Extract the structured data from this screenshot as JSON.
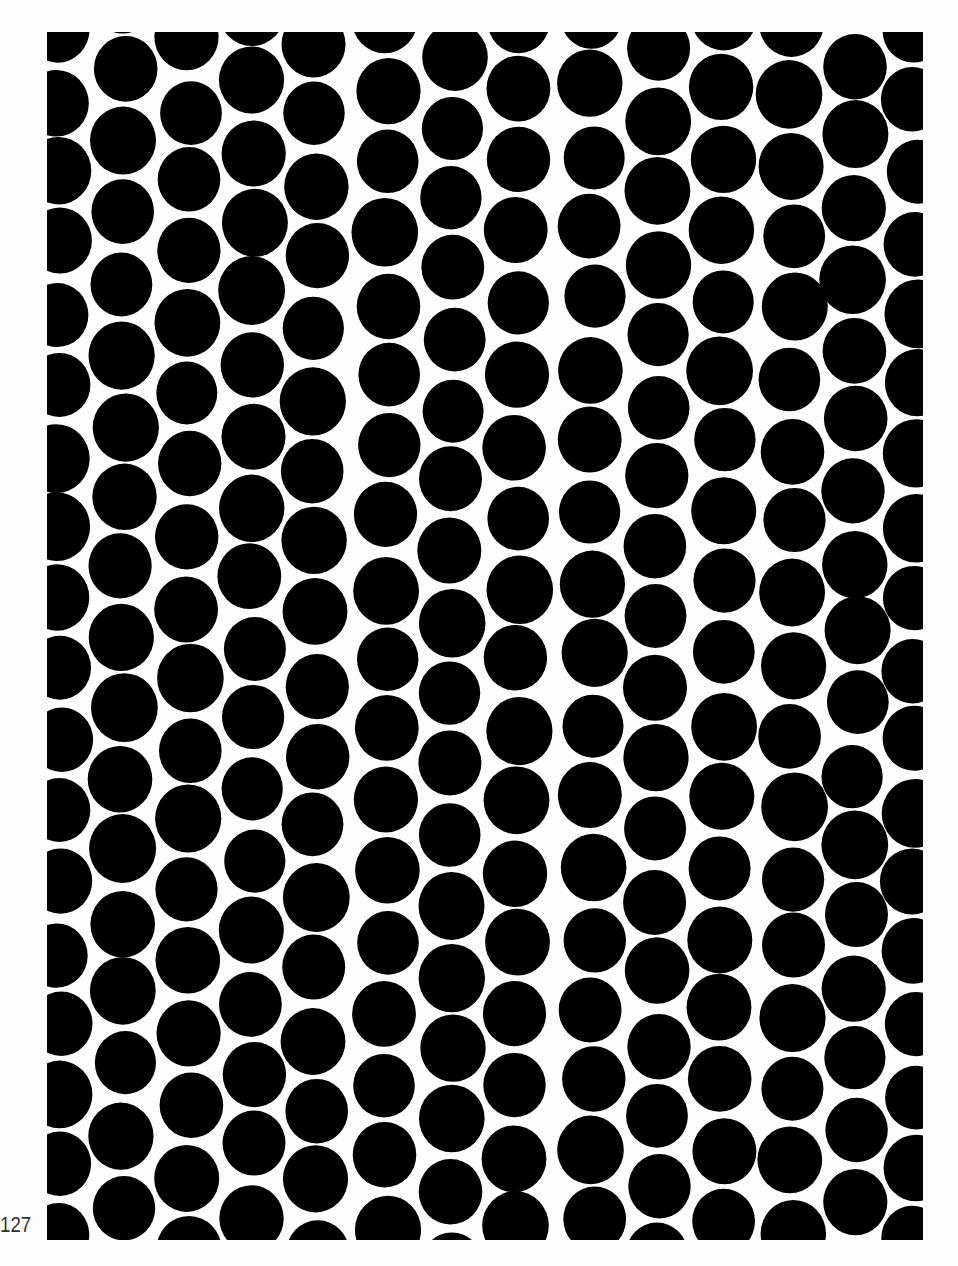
{
  "page": {
    "page_number": "127",
    "pattern": {
      "type": "packed-black-circles",
      "fill_color": "#000000",
      "background_color": "#fdfdfd",
      "circle_radius": 32,
      "row_spacing": 71,
      "columns": [
        {
          "x": 12,
          "offset": 30
        },
        {
          "x": 76,
          "offset": 70
        },
        {
          "x": 142,
          "offset": 40
        },
        {
          "x": 205,
          "offset": 80
        },
        {
          "x": 268,
          "offset": 45
        },
        {
          "x": 340,
          "offset": 20
        },
        {
          "x": 405,
          "offset": 55
        },
        {
          "x": 470,
          "offset": 20
        },
        {
          "x": 545,
          "offset": 15
        },
        {
          "x": 610,
          "offset": 50
        },
        {
          "x": 675,
          "offset": 15
        },
        {
          "x": 745,
          "offset": 25
        },
        {
          "x": 808,
          "offset": 65
        },
        {
          "x": 868,
          "offset": 30
        }
      ]
    }
  }
}
